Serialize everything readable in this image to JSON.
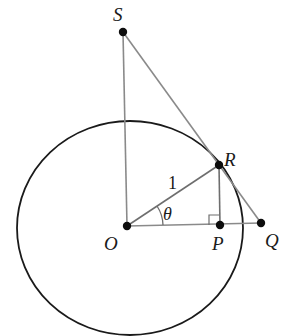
{
  "diagram": {
    "colors": {
      "circle": "#1a1a1a",
      "construction_line": "#8a8a8a",
      "radius_line": "#6e6e6e",
      "point": "#0d0d0d",
      "text": "#1a1a1a"
    },
    "circle": {
      "label": "unit circle",
      "radius_label": "1"
    },
    "points": {
      "S": {
        "label": "S"
      },
      "R": {
        "label": "R"
      },
      "O": {
        "label": "O"
      },
      "P": {
        "label": "P"
      },
      "Q": {
        "label": "Q"
      }
    },
    "angle": {
      "label": "θ"
    },
    "segments": [
      "SO",
      "SQ",
      "OQ",
      "OR",
      "RP"
    ],
    "annotations": {
      "right_angle_at": "P"
    }
  }
}
